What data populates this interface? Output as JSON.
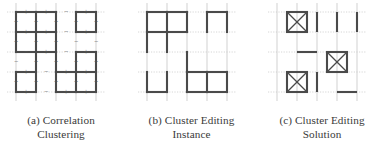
{
  "figure": {
    "type": "academic-figure",
    "background_color": "#ffffff",
    "edge_color": "#4a4a4a",
    "grid_color": "#cccccc",
    "sign_color": "#555555"
  },
  "panels": [
    {
      "id": "panel-a",
      "label": "(a)",
      "caption_line1": "(a) Correlation",
      "caption_line2": "Clustering",
      "caption_full": "(a) Correlation Clustering",
      "description": "Grid graph with solid cluster boundary edges and plus/minus edge labels"
    },
    {
      "id": "panel-b",
      "label": "(b)",
      "caption_line1": "(b) Cluster Editing",
      "caption_line2": "Instance",
      "caption_full": "(b) Cluster Editing Instance",
      "description": "Grid graph showing the cluster editing instance edges"
    },
    {
      "id": "panel-c",
      "label": "(c)",
      "caption_line1": "(c) Cluster Editing",
      "caption_line2": "Solution",
      "caption_full": "(c) Cluster Editing Solution",
      "description": "Solution showing crossed boxes and individual edge segments"
    }
  ],
  "chart_data": {
    "type": "diagram",
    "grid": {
      "cols": 5,
      "rows": 5,
      "spacing": 20,
      "origin_x": 10,
      "origin_y": 10
    },
    "panel_a": {
      "caption": "(a) Correlation Clustering",
      "background_grid": true,
      "edges": [
        {
          "x1": 1,
          "y1": 1,
          "x2": 2,
          "y2": 1
        },
        {
          "x1": 2,
          "y1": 1,
          "x2": 3,
          "y2": 1
        },
        {
          "x1": 4,
          "y1": 1,
          "x2": 5,
          "y2": 1
        },
        {
          "x1": 1,
          "y1": 2,
          "x2": 2,
          "y2": 2
        },
        {
          "x1": 2,
          "y1": 2,
          "x2": 3,
          "y2": 2
        },
        {
          "x1": 4,
          "y1": 2,
          "x2": 5,
          "y2": 2
        },
        {
          "x1": 1,
          "y1": 3,
          "x2": 2,
          "y2": 3
        },
        {
          "x1": 2,
          "y1": 3,
          "x2": 3,
          "y2": 3
        },
        {
          "x1": 4,
          "y1": 3,
          "x2": 5,
          "y2": 3
        },
        {
          "x1": 1,
          "y1": 4,
          "x2": 2,
          "y2": 4
        },
        {
          "x1": 3,
          "y1": 4,
          "x2": 4,
          "y2": 4
        },
        {
          "x1": 4,
          "y1": 4,
          "x2": 5,
          "y2": 4
        },
        {
          "x1": 1,
          "y1": 5,
          "x2": 2,
          "y2": 5
        },
        {
          "x1": 3,
          "y1": 5,
          "x2": 4,
          "y2": 5
        },
        {
          "x1": 4,
          "y1": 5,
          "x2": 5,
          "y2": 5
        },
        {
          "x1": 1,
          "y1": 1,
          "x2": 1,
          "y2": 2
        },
        {
          "x1": 2,
          "y1": 1,
          "x2": 2,
          "y2": 2
        },
        {
          "x1": 3,
          "y1": 1,
          "x2": 3,
          "y2": 2
        },
        {
          "x1": 4,
          "y1": 1,
          "x2": 4,
          "y2": 2
        },
        {
          "x1": 5,
          "y1": 1,
          "x2": 5,
          "y2": 2
        },
        {
          "x1": 1,
          "y1": 2,
          "x2": 1,
          "y2": 3
        },
        {
          "x1": 2,
          "y1": 2,
          "x2": 2,
          "y2": 3
        },
        {
          "x1": 3,
          "y1": 2,
          "x2": 3,
          "y2": 3
        },
        {
          "x1": 2,
          "y1": 3,
          "x2": 2,
          "y2": 4
        },
        {
          "x1": 3,
          "y1": 3,
          "x2": 3,
          "y2": 4
        },
        {
          "x1": 4,
          "y1": 3,
          "x2": 4,
          "y2": 4
        },
        {
          "x1": 5,
          "y1": 3,
          "x2": 5,
          "y2": 4
        },
        {
          "x1": 1,
          "y1": 4,
          "x2": 1,
          "y2": 5
        },
        {
          "x1": 2,
          "y1": 4,
          "x2": 2,
          "y2": 5
        },
        {
          "x1": 3,
          "y1": 4,
          "x2": 3,
          "y2": 5
        },
        {
          "x1": 4,
          "y1": 4,
          "x2": 4,
          "y2": 5
        },
        {
          "x1": 5,
          "y1": 4,
          "x2": 5,
          "y2": 5
        }
      ],
      "signs": [
        {
          "x": 1.5,
          "y": 1,
          "sign": "+"
        },
        {
          "x": 2.5,
          "y": 1,
          "sign": "+"
        },
        {
          "x": 3.5,
          "y": 1,
          "sign": "-"
        },
        {
          "x": 4.5,
          "y": 1,
          "sign": "+"
        },
        {
          "x": 1,
          "y": 1.5,
          "sign": "+"
        },
        {
          "x": 2,
          "y": 1.5,
          "sign": "+"
        },
        {
          "x": 3,
          "y": 1.5,
          "sign": "+"
        },
        {
          "x": 4,
          "y": 1.5,
          "sign": "+"
        },
        {
          "x": 5,
          "y": 1.5,
          "sign": "+"
        },
        {
          "x": 1.5,
          "y": 2,
          "sign": "+"
        },
        {
          "x": 2.5,
          "y": 2,
          "sign": "+"
        },
        {
          "x": 3.5,
          "y": 2,
          "sign": "-"
        },
        {
          "x": 4.5,
          "y": 2,
          "sign": "+"
        },
        {
          "x": 1,
          "y": 2.5,
          "sign": "+"
        },
        {
          "x": 2,
          "y": 2.5,
          "sign": "+"
        },
        {
          "x": 3,
          "y": 2.5,
          "sign": "+"
        },
        {
          "x": 4,
          "y": 2.5,
          "sign": "-"
        },
        {
          "x": 5,
          "y": 2.5,
          "sign": "-"
        },
        {
          "x": 1.5,
          "y": 3,
          "sign": "-"
        },
        {
          "x": 2.5,
          "y": 3,
          "sign": "+"
        },
        {
          "x": 3.5,
          "y": 3,
          "sign": "-"
        },
        {
          "x": 4.5,
          "y": 3,
          "sign": "+"
        },
        {
          "x": 1,
          "y": 3.5,
          "sign": "-"
        },
        {
          "x": 2,
          "y": 3.5,
          "sign": "+"
        },
        {
          "x": 3,
          "y": 3.5,
          "sign": "+"
        },
        {
          "x": 4,
          "y": 3.5,
          "sign": "+"
        },
        {
          "x": 5,
          "y": 3.5,
          "sign": "+"
        },
        {
          "x": 1.5,
          "y": 4,
          "sign": "+"
        },
        {
          "x": 2.5,
          "y": 4,
          "sign": "-"
        },
        {
          "x": 3.5,
          "y": 4,
          "sign": "+"
        },
        {
          "x": 4.5,
          "y": 4,
          "sign": "+"
        },
        {
          "x": 1,
          "y": 4.5,
          "sign": "+"
        },
        {
          "x": 2,
          "y": 4.5,
          "sign": "+"
        },
        {
          "x": 3,
          "y": 4.5,
          "sign": "+"
        },
        {
          "x": 4,
          "y": 4.5,
          "sign": "+"
        },
        {
          "x": 5,
          "y": 4.5,
          "sign": "+"
        },
        {
          "x": 1.5,
          "y": 5,
          "sign": "+"
        },
        {
          "x": 2.5,
          "y": 5,
          "sign": "-"
        },
        {
          "x": 3.5,
          "y": 5,
          "sign": "+"
        },
        {
          "x": 4.5,
          "y": 5,
          "sign": "+"
        }
      ]
    },
    "panel_b": {
      "caption": "(b) Cluster Editing Instance",
      "background_grid": true,
      "edges": [
        {
          "x1": 1,
          "y1": 1,
          "x2": 2,
          "y2": 1
        },
        {
          "x1": 2,
          "y1": 1,
          "x2": 3,
          "y2": 1
        },
        {
          "x1": 4,
          "y1": 1,
          "x2": 5,
          "y2": 1
        },
        {
          "x1": 1,
          "y1": 2,
          "x2": 2,
          "y2": 2
        },
        {
          "x1": 2,
          "y1": 2,
          "x2": 3,
          "y2": 2
        },
        {
          "x1": 3,
          "y1": 4,
          "x2": 4,
          "y2": 4
        },
        {
          "x1": 4,
          "y1": 4,
          "x2": 5,
          "y2": 4
        },
        {
          "x1": 1,
          "y1": 5,
          "x2": 2,
          "y2": 5
        },
        {
          "x1": 3,
          "y1": 5,
          "x2": 4,
          "y2": 5
        },
        {
          "x1": 4,
          "y1": 5,
          "x2": 5,
          "y2": 5
        },
        {
          "x1": 1,
          "y1": 1,
          "x2": 1,
          "y2": 2
        },
        {
          "x1": 2,
          "y1": 1,
          "x2": 2,
          "y2": 2
        },
        {
          "x1": 3,
          "y1": 1,
          "x2": 3,
          "y2": 2
        },
        {
          "x1": 4,
          "y1": 1,
          "x2": 4,
          "y2": 2
        },
        {
          "x1": 5,
          "y1": 1,
          "x2": 5,
          "y2": 2
        },
        {
          "x1": 1,
          "y1": 2,
          "x2": 1,
          "y2": 3
        },
        {
          "x1": 2,
          "y1": 2,
          "x2": 2,
          "y2": 3
        },
        {
          "x1": 3,
          "y1": 3,
          "x2": 3,
          "y2": 4
        },
        {
          "x1": 3,
          "y1": 4,
          "x2": 3,
          "y2": 5
        },
        {
          "x1": 4,
          "y1": 4,
          "x2": 4,
          "y2": 5
        },
        {
          "x1": 5,
          "y1": 4,
          "x2": 5,
          "y2": 5
        },
        {
          "x1": 1,
          "y1": 4,
          "x2": 1,
          "y2": 5
        },
        {
          "x1": 2,
          "y1": 4,
          "x2": 2,
          "y2": 5
        }
      ]
    },
    "panel_c": {
      "caption": "(c) Cluster Editing Solution",
      "background_grid": true,
      "boxes": [
        {
          "x": 2,
          "y": 1.5,
          "marker": "x-cross"
        },
        {
          "x": 4,
          "y": 3.5,
          "marker": "x-cross"
        },
        {
          "x": 2,
          "y": 4.5,
          "marker": "x-cross"
        }
      ],
      "segments": [
        {
          "x1": 3,
          "y1": 1,
          "x2": 3,
          "y2": 2,
          "orientation": "vertical"
        },
        {
          "x1": 4,
          "y1": 1,
          "x2": 4,
          "y2": 2,
          "orientation": "vertical"
        },
        {
          "x1": 5,
          "y1": 1,
          "x2": 5,
          "y2": 2,
          "orientation": "vertical"
        },
        {
          "x1": 2,
          "y1": 3,
          "x2": 3,
          "y2": 3,
          "orientation": "horizontal"
        },
        {
          "x1": 3,
          "y1": 4,
          "x2": 3,
          "y2": 5,
          "orientation": "vertical"
        },
        {
          "x1": 4,
          "y1": 5,
          "x2": 5,
          "y2": 5,
          "orientation": "horizontal"
        }
      ]
    }
  }
}
